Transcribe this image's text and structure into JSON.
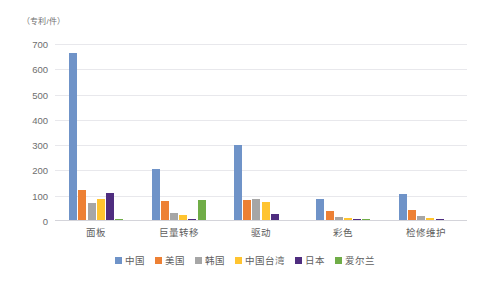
{
  "chart_data": {
    "type": "bar",
    "title": "",
    "subtitle": "",
    "xlabel": "",
    "ylabel": "（专利/件）",
    "unit_label": "（专利/件）",
    "ylim": [
      0,
      700
    ],
    "ytick_labels": [
      "700",
      "600",
      "500",
      "400",
      "300",
      "200",
      "100",
      "0"
    ],
    "ytick_values": [
      700,
      600,
      500,
      400,
      300,
      200,
      100,
      0
    ],
    "grid": true,
    "legend_position": "bottom",
    "categories": [
      "面板",
      "巨量转移",
      "驱动",
      "彩色",
      "检修维护"
    ],
    "series": [
      {
        "name": "中国",
        "color": "#6f93c8",
        "values": [
          665,
          205,
          300,
          88,
          105
        ]
      },
      {
        "name": "美国",
        "color": "#ed8034",
        "values": [
          122,
          80,
          85,
          40,
          42
        ]
      },
      {
        "name": "韩国",
        "color": "#a6a6a6",
        "values": [
          72,
          30,
          88,
          16,
          20
        ]
      },
      {
        "name": "中国台湾",
        "color": "#ffc430",
        "values": [
          88,
          25,
          75,
          10,
          12
        ]
      },
      {
        "name": "日本",
        "color": "#4f2d7f",
        "values": [
          110,
          9,
          28,
          8,
          9
        ]
      },
      {
        "name": "爱尔兰",
        "color": "#70ad47",
        "values": [
          6,
          85,
          5,
          8,
          5
        ]
      }
    ]
  }
}
